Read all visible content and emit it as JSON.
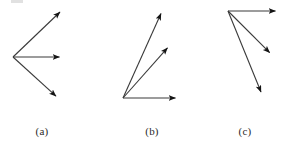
{
  "figure": {
    "type": "vector-diagram",
    "background_color": "#ffffff",
    "stroke_color": "#3a3a3a",
    "stroke_width": 1.1,
    "arrowhead_color": "#141414",
    "width": 290,
    "height": 148,
    "panels": [
      {
        "id": "a",
        "label": "(a)",
        "label_x": 42,
        "label_y": 131,
        "origin": {
          "x": 13,
          "y": 57
        },
        "vector_count": 3,
        "vectors": [
          {
            "name": "upper-arrow",
            "x1": 13,
            "y1": 57,
            "x2": 62,
            "y2": 10,
            "length": 68,
            "angle_deg": 43.8
          },
          {
            "name": "middle-arrow",
            "x1": 13,
            "y1": 57,
            "x2": 62,
            "y2": 57,
            "length": 49,
            "angle_deg": 0
          },
          {
            "name": "lower-arrow",
            "x1": 13,
            "y1": 57,
            "x2": 58,
            "y2": 98,
            "length": 61,
            "angle_deg": -42.3
          }
        ]
      },
      {
        "id": "b",
        "label": "(b)",
        "label_x": 152,
        "label_y": 131,
        "origin": {
          "x": 123,
          "y": 98
        },
        "vector_count": 3,
        "vectors": [
          {
            "name": "steep-arrow",
            "x1": 123,
            "y1": 98,
            "x2": 163,
            "y2": 9,
            "length": 97.6,
            "angle_deg": 65.8
          },
          {
            "name": "middle-arrow",
            "x1": 123,
            "y1": 98,
            "x2": 170,
            "y2": 45,
            "length": 70.8,
            "angle_deg": 48.4
          },
          {
            "name": "horizontal-arrow",
            "x1": 123,
            "y1": 98,
            "x2": 178,
            "y2": 98,
            "length": 55,
            "angle_deg": 0
          }
        ]
      },
      {
        "id": "c",
        "label": "(c)",
        "label_x": 245,
        "label_y": 131,
        "origin": {
          "x": 228,
          "y": 11
        },
        "vector_count": 3,
        "vectors": [
          {
            "name": "horizontal-arrow",
            "x1": 228,
            "y1": 11,
            "x2": 278,
            "y2": 11,
            "length": 50,
            "angle_deg": 0
          },
          {
            "name": "middle-arrow",
            "x1": 228,
            "y1": 11,
            "x2": 272,
            "y2": 55,
            "length": 62.2,
            "angle_deg": -45
          },
          {
            "name": "steep-arrow",
            "x1": 228,
            "y1": 11,
            "x2": 263,
            "y2": 97,
            "length": 92.9,
            "angle_deg": -67.9
          }
        ]
      }
    ],
    "artifact": {
      "name": "scan-smudge",
      "x": 11,
      "y": 0,
      "width": 12,
      "height": 3,
      "color": "#c9c9c9"
    }
  }
}
